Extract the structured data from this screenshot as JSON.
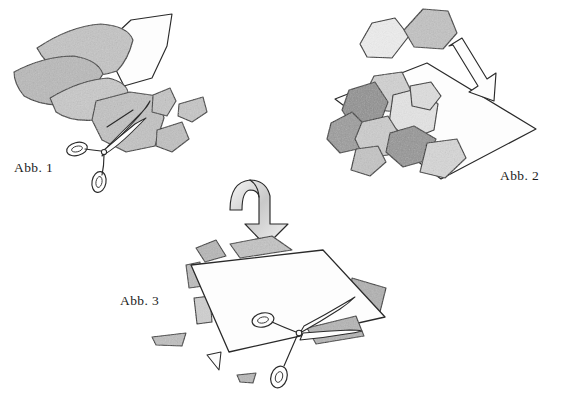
{
  "document": {
    "title": "Abb. 1 / Abb. 2 / Abb. 3",
    "background_color": "#ffffff",
    "ink_color": "#2a2a2a",
    "technique": "pencil line drawing with graphite shading",
    "subject": "paper sheets being cut with scissors into pieces and reassembled"
  },
  "figures": [
    {
      "id": "fig1",
      "label": "Abb. 1",
      "label_x": 14,
      "label_y": 172,
      "caption_position": "bottom-left",
      "description": "Stack of loose paper sheets with a pair of scissors cutting a sheet; several cut-off fragments lie at the right.",
      "contents": {
        "large_sheets": 4,
        "cut_fragments": 3,
        "scissors": 1
      }
    },
    {
      "id": "fig2",
      "label": "Abb. 2",
      "label_x": 500,
      "label_y": 180,
      "caption_position": "bottom-right",
      "description": "A large sheet in perspective covered with many irregular polygonal paper pieces; two further pieces float above and an arrow points down onto the sheet.",
      "contents": {
        "base_sheet": 1,
        "polygon_pieces": 9,
        "floating_pieces": 2,
        "arrow": "straight-outline-arrow"
      }
    },
    {
      "id": "fig3",
      "label": "Abb. 3",
      "label_x": 120,
      "label_y": 305,
      "caption_position": "left",
      "description": "A large reassembled white sheet seen in perspective with scissors lying on it, gray scraps peeking out behind its edges and small scraps on the ground.",
      "contents": {
        "large_sheet": 1,
        "hidden_pieces": 6,
        "loose_scraps": 3,
        "scissors": 1,
        "arrow": "curved-ribbon-arrow"
      }
    }
  ],
  "arrows": [
    {
      "name": "arrow-fig1-to-fig2",
      "style": "straight outline arrow",
      "direction": "down-right",
      "x": 470,
      "y": 80
    },
    {
      "name": "arrow-fig2-to-fig3",
      "style": "curved ribbon arrow with gray shading",
      "direction": "curving down",
      "x": 265,
      "y": 205
    }
  ],
  "palette": {
    "paper_white": "#fdfdfd",
    "paper_light_gray": "#dcdcdc",
    "paper_mid_gray": "#bdbdbd",
    "paper_dark_gray": "#9a9a9a",
    "paper_darkest_gray": "#8a8a8a",
    "outline": "#2a2a2a",
    "label_text": "#1b1b1b",
    "background": "#ffffff"
  }
}
